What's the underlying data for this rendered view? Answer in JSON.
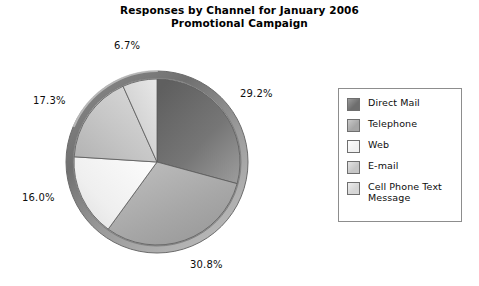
{
  "title": {
    "line1": "Responses by Channel for January 2006",
    "line2": "Promotional Campaign"
  },
  "legend": {
    "items": [
      {
        "label": "Direct Mail",
        "color": "#6e6e6e",
        "color_light": "#9b9b9b"
      },
      {
        "label": "Telephone",
        "color": "#a6a6a6",
        "color_light": "#c9c9c9"
      },
      {
        "label": "Web",
        "color": "#f1f1f1",
        "color_light": "#fdfdfd"
      },
      {
        "label": "E-mail",
        "color": "#c6c6c6",
        "color_light": "#e4e4e4"
      },
      {
        "label": "Cell Phone Text Message",
        "color": "#d6d6d6",
        "color_light": "#eeeeee"
      }
    ]
  },
  "labels": {
    "direct_mail": "29.2%",
    "telephone": "30.8%",
    "web": "16.0%",
    "email": "17.3%",
    "cellphone": "6.7%"
  },
  "chart_data": {
    "type": "pie",
    "title": "Responses by Channel for January 2006 Promotional Campaign",
    "categories": [
      "Direct Mail",
      "Telephone",
      "Web",
      "E-mail",
      "Cell Phone Text Message"
    ],
    "values": [
      29.2,
      30.8,
      16.0,
      17.3,
      6.7
    ],
    "value_labels": [
      "29.2%",
      "30.8%",
      "16.0%",
      "17.3%",
      "6.7%"
    ],
    "units": "percent",
    "total": 100.0,
    "start_angle_deg": 0,
    "direction": "clockwise",
    "legend_position": "right",
    "grid": false,
    "style": "grayscale-3d-bevel",
    "slice_colors": [
      "#6e6e6e",
      "#a6a6a6",
      "#f1f1f1",
      "#c6c6c6",
      "#d6d6d6"
    ]
  }
}
